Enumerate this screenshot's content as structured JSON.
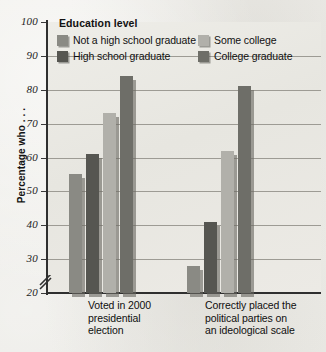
{
  "chart_data": {
    "type": "bar",
    "title": "",
    "xlabel": "",
    "ylabel": "Percentage who . . .",
    "ylim": [
      20,
      100
    ],
    "ytick_values": [
      100,
      90,
      80,
      70,
      60,
      50,
      40,
      30,
      20
    ],
    "ytick_labels": [
      "100",
      "90",
      "80",
      "70",
      "60",
      "50",
      "40",
      "30",
      "20"
    ],
    "axis_break": true,
    "grid": true,
    "legend_title": "Education level",
    "legend_position": "top-inside",
    "categories": [
      "Voted in 2000 presidential election",
      "Correctly placed the political parties on an ideological scale"
    ],
    "category_label_lines": [
      [
        "Voted in 2000",
        "presidential",
        "election"
      ],
      [
        "Correctly placed the",
        "political parties on",
        "an ideological scale"
      ]
    ],
    "series": [
      {
        "name": "Not a high school graduate",
        "color": "#8a8a84",
        "values": [
          55,
          28
        ]
      },
      {
        "name": "High school graduate",
        "color": "#565651",
        "values": [
          61,
          41
        ]
      },
      {
        "name": "Some college",
        "color": "#b1b0aa",
        "values": [
          73,
          62
        ]
      },
      {
        "name": "College graduate",
        "color": "#6e6e68",
        "values": [
          84,
          81
        ]
      }
    ]
  }
}
